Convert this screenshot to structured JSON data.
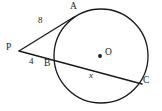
{
  "figure": {
    "type": "circle-tangent-secant-geometry",
    "background_color": "#ffffff",
    "stroke_color": "#1a1a1a",
    "width": 162,
    "height": 111
  },
  "circle": {
    "label": "circle O",
    "center_x": 101,
    "center_y": 56,
    "radius": 47
  },
  "points": {
    "A": {
      "label": "A",
      "x": 73,
      "y": 17,
      "label_x": 70,
      "label_y": 2
    },
    "B": {
      "label": "B",
      "x": 56,
      "y": 60,
      "label_x": 44,
      "label_y": 59
    },
    "C": {
      "label": "C",
      "x": 141,
      "y": 83,
      "label_x": 143,
      "label_y": 76
    },
    "O": {
      "label": "O",
      "x": 101,
      "y": 56,
      "label_x": 105,
      "label_y": 48
    },
    "P": {
      "label": "P",
      "x": 19,
      "y": 51,
      "label_x": 6,
      "label_y": 43
    }
  },
  "segments": {
    "tangent": {
      "name": "PA",
      "from": "P",
      "to": "A",
      "measure_label": "8",
      "measure_x": 38,
      "measure_y": 16
    },
    "secant_external": {
      "name": "PB",
      "from": "P",
      "to": "B",
      "measure_label": "4",
      "measure_x": 29,
      "measure_y": 57
    },
    "chord": {
      "name": "BC",
      "from": "B",
      "to": "C",
      "measure_label": "x",
      "measure_x": 89,
      "measure_y": 71
    }
  },
  "labels": [
    {
      "id": "label-A",
      "name": "point-label-a",
      "text": "A",
      "x": 70,
      "y": 2,
      "kind": "point"
    },
    {
      "id": "label-eight",
      "name": "segment-length-8",
      "text": "8",
      "x": 38,
      "y": 16,
      "kind": "measure"
    },
    {
      "id": "label-P",
      "name": "point-label-p",
      "text": "P",
      "x": 6,
      "y": 43,
      "kind": "point"
    },
    {
      "id": "label-four",
      "name": "segment-length-4",
      "text": "4",
      "x": 29,
      "y": 57,
      "kind": "measure"
    },
    {
      "id": "label-B",
      "name": "point-label-b",
      "text": "B",
      "x": 44,
      "y": 59,
      "kind": "point"
    },
    {
      "id": "label-O",
      "name": "center-label-o",
      "text": "O",
      "x": 105,
      "y": 48,
      "kind": "point"
    },
    {
      "id": "label-x",
      "name": "unknown-length-x",
      "text": "x",
      "x": 89,
      "y": 71,
      "kind": "var"
    },
    {
      "id": "label-C",
      "name": "point-label-c",
      "text": "C",
      "x": 143,
      "y": 76,
      "kind": "point"
    }
  ]
}
